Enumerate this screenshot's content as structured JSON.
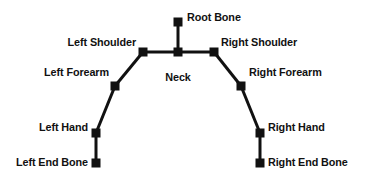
{
  "diagram": {
    "background_color": "#ffffff",
    "bone_color": "#111111",
    "joint_size_px": 9,
    "bone_thickness_px": 3,
    "joints": [
      {
        "id": "root_bone",
        "label": "Root Bone",
        "x": 178,
        "y": 22,
        "label_x": 187,
        "label_y": 11,
        "align": "left"
      },
      {
        "id": "neck",
        "label": "Neck",
        "x": 178,
        "y": 52,
        "label_x": 178,
        "label_y": 71,
        "align": "center"
      },
      {
        "id": "left_shoulder",
        "label": "Left Shoulder",
        "x": 143,
        "y": 52,
        "label_x": 136,
        "label_y": 36,
        "align": "right"
      },
      {
        "id": "right_shoulder",
        "label": "Right Shoulder",
        "x": 214,
        "y": 52,
        "label_x": 221,
        "label_y": 36,
        "align": "left"
      },
      {
        "id": "left_forearm",
        "label": "Left Forearm",
        "x": 115,
        "y": 86,
        "label_x": 109,
        "label_y": 66,
        "align": "right"
      },
      {
        "id": "right_forearm",
        "label": "Right Forearm",
        "x": 241,
        "y": 86,
        "label_x": 249,
        "label_y": 66,
        "align": "left"
      },
      {
        "id": "left_hand",
        "label": "Left Hand",
        "x": 96,
        "y": 133,
        "label_x": 88,
        "label_y": 121,
        "align": "right"
      },
      {
        "id": "right_hand",
        "label": "Right Hand",
        "x": 260,
        "y": 133,
        "label_x": 268,
        "label_y": 121,
        "align": "left"
      },
      {
        "id": "left_end_bone",
        "label": "Left End Bone",
        "x": 96,
        "y": 163,
        "label_x": 88,
        "label_y": 156,
        "align": "right"
      },
      {
        "id": "right_end_bone",
        "label": "Right End Bone",
        "x": 260,
        "y": 163,
        "label_x": 268,
        "label_y": 156,
        "align": "left"
      }
    ],
    "bones": [
      {
        "id": "bone-root-neck",
        "from": "root_bone",
        "to": "neck"
      },
      {
        "id": "bone-neck-left-shoulder",
        "from": "neck",
        "to": "left_shoulder"
      },
      {
        "id": "bone-neck-right-shoulder",
        "from": "neck",
        "to": "right_shoulder"
      },
      {
        "id": "bone-left-shoulder-forearm",
        "from": "left_shoulder",
        "to": "left_forearm"
      },
      {
        "id": "bone-right-shoulder-forearm",
        "from": "right_shoulder",
        "to": "right_forearm"
      },
      {
        "id": "bone-left-forearm-hand",
        "from": "left_forearm",
        "to": "left_hand"
      },
      {
        "id": "bone-right-forearm-hand",
        "from": "right_forearm",
        "to": "right_hand"
      },
      {
        "id": "bone-left-hand-end",
        "from": "left_hand",
        "to": "left_end_bone"
      },
      {
        "id": "bone-right-hand-end",
        "from": "right_hand",
        "to": "right_end_bone"
      }
    ]
  }
}
